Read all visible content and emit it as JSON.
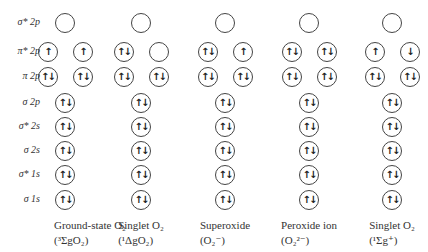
{
  "diagram": {
    "type": "molecular-orbital-occupancy",
    "rows": [
      {
        "key": "s2p_star",
        "label": "σ* 2p",
        "y": 23,
        "degenerate": false
      },
      {
        "key": "p2p_star",
        "label": "π* 2p",
        "y": 52,
        "degenerate": true
      },
      {
        "key": "p2p",
        "label": "π 2p",
        "y": 77,
        "degenerate": true
      },
      {
        "key": "s2p",
        "label": "σ 2p",
        "y": 103,
        "degenerate": false
      },
      {
        "key": "s2s_star",
        "label": "σ* 2s",
        "y": 127,
        "degenerate": false
      },
      {
        "key": "s2s",
        "label": "σ 2s",
        "y": 151,
        "degenerate": false
      },
      {
        "key": "s1s_star",
        "label": "σ* 1s",
        "y": 175,
        "degenerate": false
      },
      {
        "key": "s1s",
        "label": "σ 1s",
        "y": 200,
        "degenerate": false
      }
    ],
    "species": [
      {
        "name": "Ground-state O₂",
        "term": "(³ΣgO₂)",
        "center": 65,
        "occupancy": {
          "s2p_star": [
            ""
          ],
          "p2p_star": [
            "↑",
            "↑"
          ],
          "p2p": [
            "⇅",
            "⇅"
          ],
          "s2p": [
            "⇅"
          ],
          "s2s_star": [
            "⇅"
          ],
          "s2s": [
            "⇅"
          ],
          "s1s_star": [
            "⇅"
          ],
          "s1s": [
            "⇅"
          ]
        }
      },
      {
        "name": "Singlet O₂",
        "term": "(¹ΔgO₂)",
        "center": 141,
        "occupancy": {
          "s2p_star": [
            ""
          ],
          "p2p_star": [
            "⇅",
            ""
          ],
          "p2p": [
            "⇅",
            "⇅"
          ],
          "s2p": [
            "⇅"
          ],
          "s2s_star": [
            "⇅"
          ],
          "s2s": [
            "⇅"
          ],
          "s1s_star": [
            "⇅"
          ],
          "s1s": [
            "⇅"
          ]
        }
      },
      {
        "name": "Superoxide",
        "term": "(O₂⁻)",
        "center": 225,
        "occupancy": {
          "s2p_star": [
            ""
          ],
          "p2p_star": [
            "⇅",
            "↑"
          ],
          "p2p": [
            "⇅",
            "⇅"
          ],
          "s2p": [
            "⇅"
          ],
          "s2s_star": [
            "⇅"
          ],
          "s2s": [
            "⇅"
          ],
          "s1s_star": [
            "⇅"
          ],
          "s1s": [
            "⇅"
          ]
        }
      },
      {
        "name": "Peroxide ion",
        "term": "(O₂²⁻)",
        "center": 309,
        "occupancy": {
          "s2p_star": [
            ""
          ],
          "p2p_star": [
            "⇅",
            "⇅"
          ],
          "p2p": [
            "⇅",
            "⇅"
          ],
          "s2p": [
            "⇅"
          ],
          "s2s_star": [
            "⇅"
          ],
          "s2s": [
            "⇅"
          ],
          "s1s_star": [
            "⇅"
          ],
          "s1s": [
            "⇅"
          ]
        }
      },
      {
        "name": "Singlet O₂",
        "term": "(¹Σg⁺)",
        "center": 392,
        "occupancy": {
          "s2p_star": [
            ""
          ],
          "p2p_star": [
            "↑",
            "↓"
          ],
          "p2p": [
            "⇅",
            "⇅"
          ],
          "s2p": [
            "⇅"
          ],
          "s2s_star": [
            "⇅"
          ],
          "s2s": [
            "⇅"
          ],
          "s1s_star": [
            "⇅"
          ],
          "s1s": [
            "⇅"
          ]
        }
      }
    ]
  },
  "colors": {
    "stroke": "#444444",
    "text": "#333333",
    "background": "#ffffff"
  }
}
